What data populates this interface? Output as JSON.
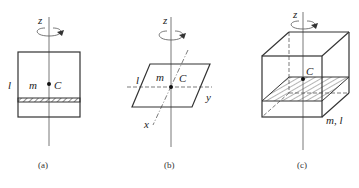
{
  "figure": {
    "panels": [
      {
        "id": "a",
        "caption": "(a)",
        "description": "Thin rectangular plate seen edge-on with hatched strip, rotating about z-axis through C",
        "labels": {
          "axis": "z",
          "length": "l",
          "mass": "m",
          "center": "C"
        }
      },
      {
        "id": "b",
        "caption": "(b)",
        "description": "Thin plate in perspective (parallelogram) with in-plane x and y axes through C, rotating about z",
        "labels": {
          "axis": "z",
          "length": "l",
          "mass": "m",
          "center": "C",
          "x_axis": "x",
          "y_axis": "y"
        }
      },
      {
        "id": "c",
        "caption": "(c)",
        "description": "Cube with hatched horizontal section through C, rotating about vertical z-axis",
        "labels": {
          "axis": "z",
          "center": "C",
          "mass_length": "m, l"
        }
      }
    ]
  }
}
